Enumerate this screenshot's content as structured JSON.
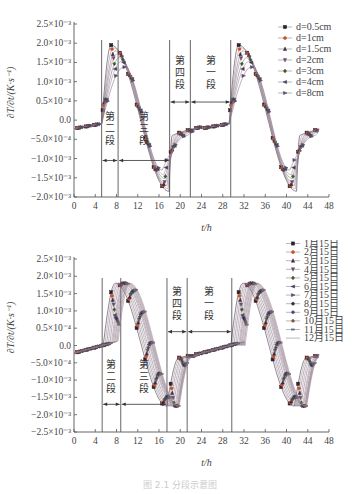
{
  "caption": "图 2.1  分段示意图",
  "chart_data": [
    {
      "type": "line",
      "title": "",
      "xlabel": "t/h",
      "ylabel": "∂T/∂t/(K·s⁻¹)",
      "xlim": [
        0,
        48
      ],
      "ylim": [
        -0.002,
        0.0025
      ],
      "x_ticks": [
        0,
        4,
        8,
        12,
        16,
        20,
        24,
        28,
        32,
        36,
        40,
        44,
        48
      ],
      "y_ticks": [
        0.0025,
        0.002,
        0.0015,
        0.001,
        0.0005,
        0,
        -0.0005,
        -0.001,
        -0.0015,
        -0.002
      ],
      "y_tick_labels": [
        "2.5×10⁻³",
        "2.0×10⁻³",
        "1.5×10⁻³",
        "1.0×10⁻³",
        "0.5×10⁻⁴",
        "0.0",
        "−5.0×10⁻⁴",
        "−1.0×10⁻³",
        "−1.5×10⁻³",
        "−2.0×10⁻³"
      ],
      "legend_position": "upper right",
      "grid": false,
      "vertical_lines": [
        5.2,
        8.3,
        18.0,
        21.9,
        29.5
      ],
      "segments": [
        {
          "label": "第二段",
          "chars": [
            "第",
            "二",
            "段"
          ],
          "x_from": 5.2,
          "x_to": 8.3,
          "arrow_y": -0.00105,
          "text_y": -0.0003
        },
        {
          "label": "第三段",
          "chars": [
            "第",
            "三",
            "段"
          ],
          "x_from": 8.3,
          "x_to": 18.0,
          "arrow_y": -0.00105,
          "text_y": -0.0003
        },
        {
          "label": "第四段",
          "chars": [
            "第",
            "四",
            "段"
          ],
          "x_from": 18.0,
          "x_to": 21.9,
          "arrow_y": 0.00047,
          "text_y": 0.00115
        },
        {
          "label": "第一段",
          "chars": [
            "第",
            "一",
            "段"
          ],
          "x_from": 21.9,
          "x_to": 29.5,
          "arrow_y": 0.00047,
          "text_y": 0.00115
        }
      ],
      "series": [
        {
          "name": "d=0.5cm",
          "marker": "square",
          "color": "#2a2030",
          "peak": 0.00195,
          "trough": -0.00185,
          "peak_t": 7.0,
          "trough_t": 17.9
        },
        {
          "name": "d=1cm",
          "marker": "circle",
          "color": "#c8552a",
          "peak": 0.00188,
          "trough": -0.00178,
          "peak_t": 7.4,
          "trough_t": 17.7
        },
        {
          "name": "d=1.5cm",
          "marker": "triangle-up",
          "color": "#3a2a3a",
          "peak": 0.0018,
          "trough": -0.0017,
          "peak_t": 7.8,
          "trough_t": 17.5
        },
        {
          "name": "d=2cm",
          "marker": "triangle-down",
          "color": "#6a4a6a",
          "peak": 0.00172,
          "trough": -0.00162,
          "peak_t": 8.1,
          "trough_t": 17.3
        },
        {
          "name": "d=3cm",
          "marker": "diamond",
          "color": "#3a5a2a",
          "peak": 0.00162,
          "trough": -0.00152,
          "peak_t": 8.5,
          "trough_t": 17.1
        },
        {
          "name": "d=4cm",
          "marker": "triangle-left",
          "color": "#4a3a5a",
          "peak": 0.00152,
          "trough": -0.00142,
          "peak_t": 8.9,
          "trough_t": 16.9
        },
        {
          "name": "d=8cm",
          "marker": "triangle-right",
          "color": "#5a4a6a",
          "peak": 0.00138,
          "trough": -0.0013,
          "peak_t": 9.4,
          "trough_t": 16.6
        }
      ],
      "legend": [
        "d=0.5cm",
        "d=1cm",
        "d=1.5cm",
        "d=2cm",
        "d=3cm",
        "d=4cm",
        "d=8cm"
      ]
    },
    {
      "type": "line",
      "title": "",
      "xlabel": "t/h",
      "ylabel": "∂T/∂t/(K·s⁻¹)",
      "xlim": [
        0,
        48
      ],
      "ylim": [
        -0.0025,
        0.0025
      ],
      "x_ticks": [
        0,
        4,
        8,
        12,
        16,
        20,
        24,
        28,
        32,
        36,
        40,
        44,
        48
      ],
      "y_ticks": [
        0.0025,
        0.002,
        0.0015,
        0.001,
        0.0005,
        0,
        -0.0005,
        -0.001,
        -0.0015,
        -0.002,
        -0.0025
      ],
      "y_tick_labels": [
        "2.5×10⁻³",
        "2.0×10⁻³",
        "1.5×10⁻³",
        "1.0×10⁻³",
        "0.5×10⁻⁴",
        "0.0",
        "−5.0×10⁻⁴",
        "−1.0×10⁻³",
        "−1.5×10⁻³",
        "−2.0×10⁻³",
        "−2.5×10⁻³"
      ],
      "legend_position": "upper right",
      "grid": false,
      "vertical_lines": [
        5.3,
        8.8,
        17.5,
        21.3,
        29.7
      ],
      "segments": [
        {
          "label": "第二段",
          "chars": [
            "第",
            "二",
            "段"
          ],
          "x_from": 5.3,
          "x_to": 8.8,
          "arrow_y": -0.0017,
          "text_y": -0.001
        },
        {
          "label": "第三段",
          "chars": [
            "第",
            "三",
            "段"
          ],
          "x_from": 8.8,
          "x_to": 17.5,
          "arrow_y": -0.0017,
          "text_y": -0.001
        },
        {
          "label": "第四段",
          "chars": [
            "第",
            "四",
            "段"
          ],
          "x_from": 17.5,
          "x_to": 21.3,
          "arrow_y": 0.0004,
          "text_y": 0.0011
        },
        {
          "label": "第一段",
          "chars": [
            "第",
            "一",
            "段"
          ],
          "x_from": 21.3,
          "x_to": 29.7,
          "arrow_y": 0.0004,
          "text_y": 0.0011
        }
      ],
      "series": [
        {
          "name": "1月15日",
          "marker": "square",
          "color": "#2a2030",
          "rise_t": 5.5,
          "set_t": 17.6
        },
        {
          "name": "2月15日",
          "marker": "circle",
          "color": "#c8552a",
          "rise_t": 5.8,
          "set_t": 17.9
        },
        {
          "name": "3月15日",
          "marker": "triangle-up",
          "color": "#3a2a3a",
          "rise_t": 6.1,
          "set_t": 18.2
        },
        {
          "name": "4月15日",
          "marker": "triangle-down",
          "color": "#6a4a6a",
          "rise_t": 6.4,
          "set_t": 18.5
        },
        {
          "name": "5月15日",
          "marker": "diamond",
          "color": "#3a5a2a",
          "rise_t": 6.7,
          "set_t": 18.8
        },
        {
          "name": "6月15日",
          "marker": "triangle-left",
          "color": "#4a3a5a",
          "rise_t": 7.0,
          "set_t": 19.1
        },
        {
          "name": "7月15日",
          "marker": "triangle-right",
          "color": "#5a4a6a",
          "rise_t": 7.2,
          "set_t": 19.3
        },
        {
          "name": "8月15日",
          "marker": "hexagon",
          "color": "#2a2a4a",
          "rise_t": 7.4,
          "set_t": 19.5
        },
        {
          "name": "9月15日",
          "marker": "star",
          "color": "#4a4a7a",
          "rise_t": 7.6,
          "set_t": 19.6
        },
        {
          "name": "10月15日",
          "marker": "pentagon",
          "color": "#8a5a2a",
          "rise_t": 7.8,
          "set_t": 19.7
        },
        {
          "name": "11月15日",
          "marker": "dash",
          "color": "#5a6a8a",
          "rise_t": 8.0,
          "set_t": 19.8
        },
        {
          "name": "12月15日",
          "marker": "none",
          "color": "#9a8a9a",
          "rise_t": 8.2,
          "set_t": 19.9
        }
      ],
      "legend": [
        "1月15日",
        "2月15日",
        "3月15日",
        "4月15日",
        "5月15日",
        "6月15日",
        "7月15日",
        "8月15日",
        "9月15日",
        "10月15日",
        "11月15日",
        "12月15日"
      ]
    }
  ]
}
